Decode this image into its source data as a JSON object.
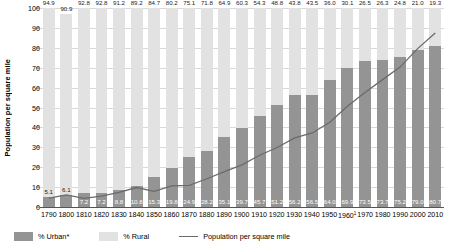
{
  "chart_data": {
    "type": "bar",
    "title": "",
    "subtitle": "",
    "xlabel": "",
    "ylabel": "Population per square mile",
    "ylim": [
      0,
      100
    ],
    "yticks": [
      0,
      10,
      20,
      30,
      40,
      50,
      60,
      70,
      80,
      90,
      100
    ],
    "grid": true,
    "legend_position": "bottom-left",
    "stacked": true,
    "categories": [
      "1790",
      "1800",
      "1810",
      "1820",
      "1830",
      "1840",
      "1850",
      "1860",
      "1870",
      "1880",
      "1890",
      "1900",
      "1910",
      "1920",
      "1930",
      "1940",
      "1950",
      "1960",
      "1970",
      "1980",
      "1990",
      "2000",
      "2010"
    ],
    "category_footnotes": {
      "1960": "1"
    },
    "series": [
      {
        "name": "% Urban*",
        "type": "bar",
        "color": "#949494",
        "values": [
          5.1,
          6.1,
          7.2,
          7.2,
          8.8,
          10.8,
          15.3,
          19.8,
          24.9,
          28.2,
          35.1,
          39.7,
          45.7,
          51.2,
          56.2,
          56.5,
          64.0,
          69.9,
          73.5,
          73.7,
          75.2,
          79.0,
          80.7
        ]
      },
      {
        "name": "% Rural",
        "type": "bar",
        "color": "#e2e2e2",
        "values": [
          94.9,
          90.9,
          92.8,
          92.8,
          91.2,
          89.2,
          84.7,
          80.2,
          75.1,
          71.8,
          64.9,
          60.3,
          54.3,
          48.8,
          43.8,
          43.5,
          36.0,
          30.1,
          26.5,
          26.3,
          24.8,
          21.0,
          19.3
        ]
      },
      {
        "name": "Population per square mile",
        "type": "line",
        "color": "#6b6b6b",
        "values": [
          4.5,
          6.1,
          4.3,
          5.5,
          7.4,
          9.8,
          7.9,
          10.6,
          10.9,
          14.2,
          17.8,
          21.2,
          26.0,
          29.9,
          34.7,
          37.2,
          42.6,
          50.6,
          57.5,
          64.0,
          70.3,
          79.6,
          87.4
        ]
      }
    ]
  },
  "legend": {
    "items": [
      {
        "label": "% Urban*",
        "type": "swatch",
        "color": "#949494"
      },
      {
        "label": "% Rural",
        "type": "swatch",
        "color": "#e2e2e2"
      },
      {
        "label": "Population per square mile",
        "type": "line",
        "color": "#6b6b6b"
      }
    ]
  }
}
